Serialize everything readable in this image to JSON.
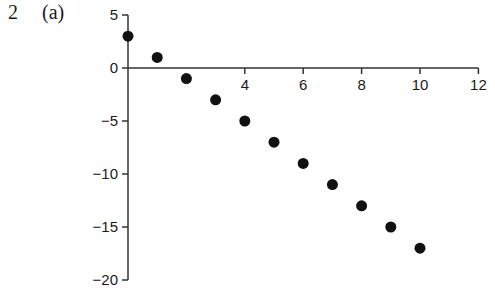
{
  "question": {
    "number": "2",
    "part": "(a)"
  },
  "chart_data": {
    "type": "scatter",
    "title": "",
    "xlabel": "",
    "ylabel": "",
    "x": [
      0,
      1,
      2,
      3,
      4,
      5,
      6,
      7,
      8,
      9,
      10
    ],
    "y": [
      3,
      1,
      -1,
      -3,
      -5,
      -7,
      -9,
      -11,
      -13,
      -15,
      -17
    ],
    "xlim": [
      0,
      12
    ],
    "ylim": [
      -20,
      5
    ],
    "x_ticks": [
      4,
      6,
      8,
      10,
      12
    ],
    "x_tick_labels": [
      "4",
      "6",
      "8",
      "10",
      "12"
    ],
    "y_ticks": [
      5,
      0,
      -5,
      -10,
      -15,
      -20
    ],
    "y_tick_labels": [
      "5",
      "0",
      "−5",
      "−10",
      "−15",
      "−20"
    ],
    "grid": false,
    "legend": null,
    "marker_color": "#111111"
  }
}
